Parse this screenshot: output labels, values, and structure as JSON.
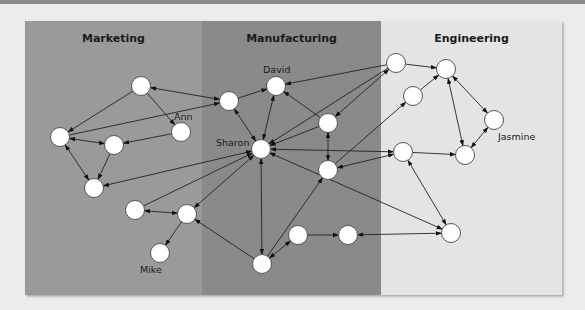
{
  "regions": [
    {
      "id": "marketing",
      "label": "Marketing",
      "x": 25,
      "width": 177,
      "color": "#9a9a9a"
    },
    {
      "id": "manufacturing",
      "label": "Manufacturing",
      "x": 202,
      "width": 179,
      "color": "#8a8a8a"
    },
    {
      "id": "engineering",
      "label": "Engineering",
      "x": 381,
      "width": 181,
      "color": "#e4e4e4"
    }
  ],
  "panel": {
    "x": 25,
    "y": 21,
    "width": 537,
    "height": 274
  },
  "nodes": [
    {
      "id": "m1",
      "x": 141,
      "y": 86,
      "label": ""
    },
    {
      "id": "mleft",
      "x": 60,
      "y": 137,
      "label": ""
    },
    {
      "id": "mmid",
      "x": 114,
      "y": 145,
      "label": ""
    },
    {
      "id": "ann",
      "x": 181,
      "y": 132,
      "label": "Ann",
      "lx": 174,
      "ly": 120
    },
    {
      "id": "mbot",
      "x": 94,
      "y": 188,
      "label": ""
    },
    {
      "id": "ml1",
      "x": 135,
      "y": 210,
      "label": ""
    },
    {
      "id": "ml2",
      "x": 187,
      "y": 214,
      "label": ""
    },
    {
      "id": "mike",
      "x": 160,
      "y": 253,
      "label": "Mike",
      "lx": 140,
      "ly": 273
    },
    {
      "id": "mf1",
      "x": 229,
      "y": 101,
      "label": ""
    },
    {
      "id": "david",
      "x": 276,
      "y": 86,
      "label": "David",
      "lx": 263,
      "ly": 73
    },
    {
      "id": "sharon",
      "x": 261,
      "y": 149,
      "label": "Sharon",
      "lx": 216,
      "ly": 146
    },
    {
      "id": "mfr1",
      "x": 328,
      "y": 123,
      "label": ""
    },
    {
      "id": "mfr2",
      "x": 328,
      "y": 170,
      "label": ""
    },
    {
      "id": "mfb",
      "x": 262,
      "y": 264,
      "label": ""
    },
    {
      "id": "mfb2",
      "x": 298,
      "y": 235,
      "label": ""
    },
    {
      "id": "mfb3",
      "x": 348,
      "y": 235,
      "label": ""
    },
    {
      "id": "e1",
      "x": 396,
      "y": 63,
      "label": ""
    },
    {
      "id": "e2",
      "x": 446,
      "y": 69,
      "label": ""
    },
    {
      "id": "e3",
      "x": 413,
      "y": 96,
      "label": ""
    },
    {
      "id": "jasmine",
      "x": 494,
      "y": 120,
      "label": "Jasmine",
      "lx": 498,
      "ly": 140
    },
    {
      "id": "emid",
      "x": 403,
      "y": 152,
      "label": ""
    },
    {
      "id": "eright",
      "x": 465,
      "y": 155,
      "label": ""
    },
    {
      "id": "ebot",
      "x": 451,
      "y": 233,
      "label": ""
    }
  ],
  "edges": [
    {
      "from": "m1",
      "to": "mleft",
      "dir": "forward"
    },
    {
      "from": "m1",
      "to": "ann",
      "dir": "forward"
    },
    {
      "from": "m1",
      "to": "mf1",
      "dir": "both"
    },
    {
      "from": "mleft",
      "to": "mf1",
      "dir": "forward"
    },
    {
      "from": "mleft",
      "to": "mmid",
      "dir": "both"
    },
    {
      "from": "ann",
      "to": "mmid",
      "dir": "forward"
    },
    {
      "from": "mleft",
      "to": "mbot",
      "dir": "both"
    },
    {
      "from": "mmid",
      "to": "mbot",
      "dir": "forward"
    },
    {
      "from": "sharon",
      "to": "mbot",
      "dir": "both"
    },
    {
      "from": "ml1",
      "to": "sharon",
      "dir": "forward"
    },
    {
      "from": "ml1",
      "to": "ml2",
      "dir": "both"
    },
    {
      "from": "ml2",
      "to": "sharon",
      "dir": "both"
    },
    {
      "from": "ml2",
      "to": "mike",
      "dir": "forward"
    },
    {
      "from": "mfb",
      "to": "ml2",
      "dir": "forward"
    },
    {
      "from": "mf1",
      "to": "david",
      "dir": "forward"
    },
    {
      "from": "mf1",
      "to": "sharon",
      "dir": "both"
    },
    {
      "from": "david",
      "to": "sharon",
      "dir": "both"
    },
    {
      "from": "mfr1",
      "to": "david",
      "dir": "forward"
    },
    {
      "from": "mfr1",
      "to": "sharon",
      "dir": "forward"
    },
    {
      "from": "mfr1",
      "to": "mfr2",
      "dir": "both"
    },
    {
      "from": "e1",
      "to": "david",
      "dir": "forward"
    },
    {
      "from": "e1",
      "to": "sharon",
      "dir": "forward"
    },
    {
      "from": "e1",
      "to": "mfr1",
      "dir": "both"
    },
    {
      "from": "e1",
      "to": "e2",
      "dir": "forward"
    },
    {
      "from": "e3",
      "to": "e2",
      "dir": "forward"
    },
    {
      "from": "mfr2",
      "to": "e3",
      "dir": "forward"
    },
    {
      "from": "e2",
      "to": "jasmine",
      "dir": "both"
    },
    {
      "from": "e2",
      "to": "eright",
      "dir": "both"
    },
    {
      "from": "jasmine",
      "to": "eright",
      "dir": "both"
    },
    {
      "from": "emid",
      "to": "eright",
      "dir": "forward"
    },
    {
      "from": "sharon",
      "to": "emid",
      "dir": "both"
    },
    {
      "from": "emid",
      "to": "mfr2",
      "dir": "both"
    },
    {
      "from": "emid",
      "to": "ebot",
      "dir": "both"
    },
    {
      "from": "sharon",
      "to": "ebot",
      "dir": "both"
    },
    {
      "from": "sharon",
      "to": "mfb",
      "dir": "both"
    },
    {
      "from": "mfb",
      "to": "mfr2",
      "dir": "forward"
    },
    {
      "from": "mfb",
      "to": "mfb2",
      "dir": "both"
    },
    {
      "from": "mfb2",
      "to": "mfb3",
      "dir": "forward"
    },
    {
      "from": "mfb3",
      "to": "ebot",
      "dir": "both"
    }
  ]
}
